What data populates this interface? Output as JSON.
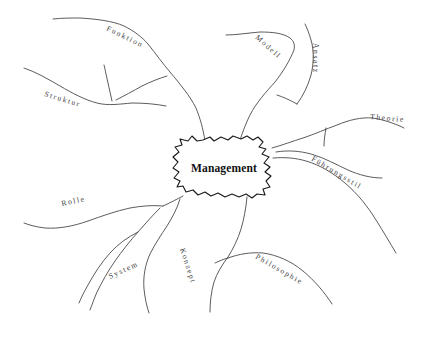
{
  "diagram": {
    "type": "mind-map",
    "title": "Management",
    "language": "de",
    "style": "hand-drawn",
    "background_color": "#ffffff",
    "line_color": "#4a4a4a",
    "text_color": "#3c3c3c",
    "center_text_color": "#111111",
    "center_outline_color": "#1a1a1a"
  },
  "center": {
    "label": "Management",
    "shape": "cloud-blob"
  },
  "branches": [
    {
      "id": "funktion",
      "label": "Funktion",
      "position": "top-left",
      "rotation": 26,
      "x": 106,
      "y": 30
    },
    {
      "id": "struktur",
      "label": "Struktur",
      "position": "left-upper",
      "rotation": 17,
      "x": 44,
      "y": 96
    },
    {
      "id": "modell",
      "label": "Modell",
      "position": "top-right",
      "rotation": 42,
      "x": 255,
      "y": 38
    },
    {
      "id": "ansatz",
      "label": "Ansatz",
      "position": "top-far-right",
      "rotation": 90,
      "x": 313,
      "y": 43
    },
    {
      "id": "theorie",
      "label": "Theorie",
      "position": "right-upper",
      "rotation": 5,
      "x": 370,
      "y": 119
    },
    {
      "id": "fuehrungsstil",
      "label": "Führungsstil",
      "position": "right-lower",
      "rotation": 31,
      "x": 311,
      "y": 160
    },
    {
      "id": "philosophie",
      "label": "Philosophie",
      "position": "bottom-right",
      "rotation": 30,
      "x": 255,
      "y": 258
    },
    {
      "id": "konzept",
      "label": "Konzept",
      "position": "bottom-center",
      "rotation": 72,
      "x": 180,
      "y": 249
    },
    {
      "id": "system",
      "label": "System",
      "position": "bottom-left",
      "rotation": -25,
      "x": 110,
      "y": 279
    },
    {
      "id": "rolle",
      "label": "Rolle",
      "position": "left-lower",
      "rotation": -12,
      "x": 62,
      "y": 206
    }
  ]
}
